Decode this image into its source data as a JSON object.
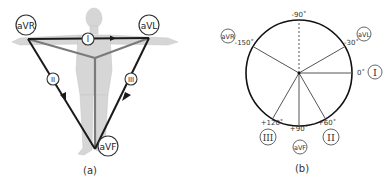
{
  "panel_a": {
    "caption": "(a)",
    "leads": {
      "aVR": "aVR",
      "aVL": "aVL",
      "aVF": "aVF",
      "I": "I",
      "II": "II",
      "III": "III"
    },
    "colors": {
      "limb_leads": "#1a1a1a",
      "augmented_leads": "#7a7a7a",
      "body": "#d4d4d4"
    }
  },
  "panel_b": {
    "caption": "(b)",
    "angles": {
      "minus90": "-90˚",
      "minus150": "-150˚",
      "minus30": "-30˚",
      "zero": "0˚",
      "plus60": "+60˚",
      "plus90": "+90˚",
      "plus120": "+120˚"
    },
    "leads": {
      "aVR": "aVR",
      "aVL": "aVL",
      "aVF": "aVF",
      "I": "I",
      "II": "II",
      "III": "III"
    }
  }
}
